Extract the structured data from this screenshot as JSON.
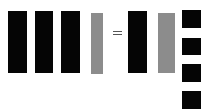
{
  "diagram": {
    "colors": {
      "black": "#050505",
      "gray": "#8c8c8c",
      "background": "#ffffff"
    },
    "left_side": [
      {
        "type": "rod",
        "color": "black"
      },
      {
        "type": "rod",
        "color": "black"
      },
      {
        "type": "rod",
        "color": "black"
      },
      {
        "type": "rod",
        "color": "gray"
      }
    ],
    "operator": "=",
    "right_side": [
      {
        "type": "rod",
        "color": "black"
      },
      {
        "type": "rod",
        "color": "gray"
      },
      {
        "type": "unit",
        "color": "black"
      },
      {
        "type": "unit",
        "color": "black"
      },
      {
        "type": "unit",
        "color": "black"
      },
      {
        "type": "unit",
        "color": "black"
      }
    ]
  }
}
